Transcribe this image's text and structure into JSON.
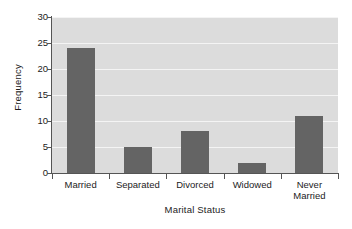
{
  "chart_data": {
    "type": "bar",
    "title": "",
    "subtitle": "",
    "xlabel": "Marital Status",
    "ylabel": "Frequency",
    "categories": [
      "Married",
      "Separated",
      "Divorced",
      "Widowed",
      "Never\nMarried"
    ],
    "values": [
      24,
      5,
      8,
      2,
      11
    ],
    "series": [
      {
        "name": "Frequency",
        "values": [
          24,
          5,
          8,
          2,
          11
        ]
      }
    ],
    "ylim": [
      0,
      30
    ],
    "yticks": [
      0,
      5,
      10,
      15,
      20,
      25,
      30
    ],
    "ytick_labels": [
      "0",
      "5",
      "10",
      "15",
      "20",
      "25",
      "30"
    ],
    "grid": true,
    "grid_axis": "y",
    "legend": false,
    "legend_position": "none",
    "annotations": [],
    "colors": {
      "bar": "#646464",
      "plot_background": "#dcdcdc",
      "figure_background": "#ffffff",
      "gridline": "#f4f4f4",
      "axis": "#555555",
      "text": "#1c1c1c"
    }
  }
}
